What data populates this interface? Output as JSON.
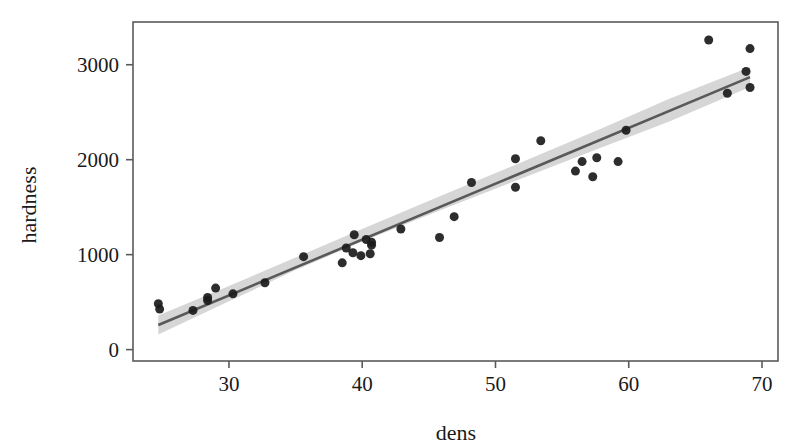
{
  "chart_data": {
    "type": "scatter",
    "title": "",
    "xlabel": "dens",
    "ylabel": "hardness",
    "xlim": [
      22.8,
      71.2
    ],
    "ylim": [
      -120,
      3450
    ],
    "xticks": [
      30,
      40,
      50,
      60,
      70
    ],
    "yticks": [
      0,
      1000,
      2000,
      3000
    ],
    "xticklabels": [
      "30",
      "40",
      "50",
      "60",
      "70"
    ],
    "yticklabels": [
      "0",
      "1000",
      "2000",
      "3000"
    ],
    "grid": false,
    "legend": null,
    "marker_color": "#1b1b1b",
    "marker_size": 9,
    "line_color": "#595959",
    "band_color": "#cfcfcf",
    "frame_color": "#5a5a5a",
    "points": [
      {
        "x": 24.7,
        "y": 484
      },
      {
        "x": 24.8,
        "y": 427
      },
      {
        "x": 27.3,
        "y": 413
      },
      {
        "x": 28.4,
        "y": 517
      },
      {
        "x": 28.4,
        "y": 549
      },
      {
        "x": 29.0,
        "y": 648
      },
      {
        "x": 30.3,
        "y": 587
      },
      {
        "x": 32.7,
        "y": 704
      },
      {
        "x": 35.6,
        "y": 979
      },
      {
        "x": 38.5,
        "y": 914
      },
      {
        "x": 38.8,
        "y": 1070
      },
      {
        "x": 39.3,
        "y": 1020
      },
      {
        "x": 39.4,
        "y": 1210
      },
      {
        "x": 39.9,
        "y": 989
      },
      {
        "x": 40.3,
        "y": 1160
      },
      {
        "x": 40.6,
        "y": 1010
      },
      {
        "x": 40.7,
        "y": 1100
      },
      {
        "x": 40.7,
        "y": 1130
      },
      {
        "x": 42.9,
        "y": 1270
      },
      {
        "x": 45.8,
        "y": 1180
      },
      {
        "x": 46.9,
        "y": 1400
      },
      {
        "x": 48.2,
        "y": 1760
      },
      {
        "x": 51.5,
        "y": 1710
      },
      {
        "x": 51.5,
        "y": 2010
      },
      {
        "x": 53.4,
        "y": 2200
      },
      {
        "x": 56.0,
        "y": 1880
      },
      {
        "x": 56.5,
        "y": 1980
      },
      {
        "x": 57.3,
        "y": 1820
      },
      {
        "x": 57.6,
        "y": 2020
      },
      {
        "x": 59.2,
        "y": 1980
      },
      {
        "x": 59.8,
        "y": 2310
      },
      {
        "x": 66.0,
        "y": 3260
      },
      {
        "x": 67.4,
        "y": 2700
      },
      {
        "x": 68.8,
        "y": 2930
      },
      {
        "x": 69.1,
        "y": 3170
      },
      {
        "x": 69.1,
        "y": 2760
      }
    ],
    "fit_line": {
      "type": "linear",
      "x_start": 24.7,
      "x_end": 69.1,
      "y_start": 259,
      "y_end": 2870
    },
    "confidence_band": {
      "x": [
        24.7,
        30.0,
        35.0,
        40.0,
        46.0,
        52.0,
        58.0,
        63.0,
        69.1
      ],
      "upper": [
        360,
        670,
        970,
        1270,
        1625,
        1975,
        2330,
        2640,
        2975
      ],
      "lower": [
        158,
        508,
        838,
        1138,
        1475,
        1805,
        2130,
        2400,
        2765
      ]
    }
  }
}
